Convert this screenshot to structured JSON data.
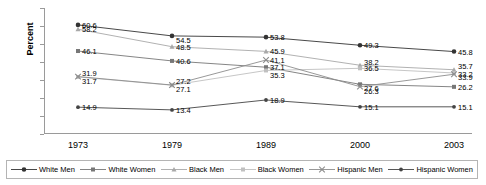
{
  "chart_data": {
    "type": "line",
    "title": "",
    "xlabel": "",
    "ylabel": "Percent",
    "categories": [
      "1973",
      "1979",
      "1989",
      "2000",
      "2003"
    ],
    "ylim": [
      0,
      70
    ],
    "yticks": [
      0,
      10,
      20,
      30,
      40,
      50,
      60,
      70
    ],
    "grid": false,
    "legend_position": "bottom",
    "series": [
      {
        "name": "White Men",
        "marker": "filled-circle",
        "color": "#333333",
        "values": [
          60.6,
          54.5,
          53.8,
          49.3,
          45.8
        ],
        "labels": [
          "60.6",
          "54.5",
          "53.8",
          "49.3",
          "45.8"
        ]
      },
      {
        "name": "White Women",
        "marker": "filled-square",
        "color": "#777777",
        "values": [
          46.1,
          40.6,
          37.1,
          27.6,
          26.2
        ],
        "labels": [
          "46.1",
          "40.6",
          "37.1",
          "27.6",
          "26.2"
        ]
      },
      {
        "name": "Black Men",
        "marker": "triangle",
        "color": "#a8a8a8",
        "values": [
          58.2,
          48.5,
          45.9,
          38.2,
          35.7
        ],
        "labels": [
          "58.2",
          "48.5",
          "45.9",
          "38.2",
          "35.7"
        ]
      },
      {
        "name": "Black Women",
        "marker": "light-square",
        "color": "#c0c0c0",
        "values": [
          31.7,
          27.1,
          35.3,
          36.5,
          33.9
        ],
        "labels": [
          "31.7",
          "27.1",
          "35.3",
          "36.5",
          "33.9"
        ]
      },
      {
        "name": "Hispanic Men",
        "marker": "cross",
        "color": "#8c8c8c",
        "values": [
          31.9,
          27.2,
          41.1,
          26.3,
          33.2
        ],
        "labels": [
          "31.9",
          "27.2",
          "41.1",
          "26.3",
          "33.2"
        ]
      },
      {
        "name": "Hispanic Women",
        "marker": "small-circle",
        "color": "#444444",
        "values": [
          14.9,
          13.4,
          18.9,
          15.1,
          15.1
        ],
        "labels": [
          "14.9",
          "13.4",
          "18.9",
          "15.1",
          "15.1"
        ]
      }
    ]
  }
}
